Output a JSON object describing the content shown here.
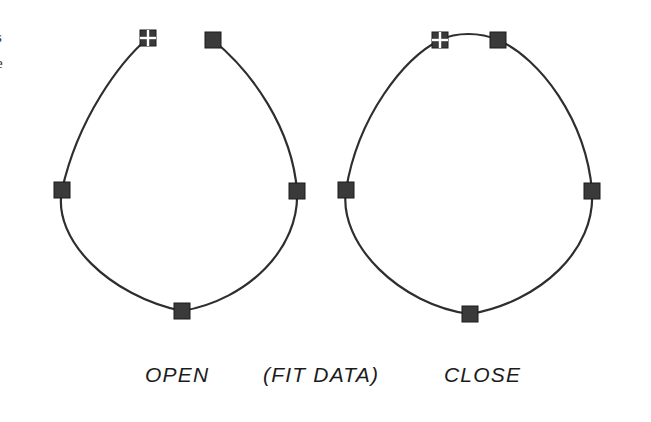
{
  "figure": {
    "type": "spline-curve-diagram",
    "background_color": "#ffffff",
    "stroke_color": "#2e2e2e",
    "marker_fill_color": "#3a3a3a",
    "marker_edge_color": "#1a1a1a",
    "marker_divider_color": "#ffffff",
    "labels": {
      "open": "OPEN",
      "fit_data": "(FIT DATA)",
      "close": "CLOSE"
    },
    "page_edge_fragments": {
      "fragment_1": "s",
      "fragment_2": "e"
    },
    "curves": [
      {
        "name": "open-curve",
        "label": "OPEN",
        "closed": false,
        "description": "Open spline: gap between start marker and end marker at top",
        "control_points": [
          {
            "name": "start-point",
            "marker": "quadrant-square",
            "x": 148,
            "y": 38
          },
          {
            "name": "left-point",
            "marker": "solid-square",
            "x": 62,
            "y": 190
          },
          {
            "name": "bottom-point",
            "marker": "solid-square",
            "x": 182,
            "y": 311
          },
          {
            "name": "right-point",
            "marker": "solid-square",
            "x": 297,
            "y": 191
          },
          {
            "name": "end-point",
            "marker": "solid-square",
            "x": 213,
            "y": 40
          }
        ]
      },
      {
        "name": "close-curve",
        "label": "CLOSE",
        "closed": true,
        "description": "Closed spline: start and end markers joined by curve at top",
        "control_points": [
          {
            "name": "start-point",
            "marker": "quadrant-square",
            "x": 440,
            "y": 40
          },
          {
            "name": "left-point",
            "marker": "solid-square",
            "x": 346,
            "y": 190
          },
          {
            "name": "bottom-point",
            "marker": "solid-square",
            "x": 470,
            "y": 314
          },
          {
            "name": "right-point",
            "marker": "solid-square",
            "x": 592,
            "y": 191
          },
          {
            "name": "end-point",
            "marker": "solid-square",
            "x": 498,
            "y": 40
          }
        ]
      }
    ],
    "marker_size": 16,
    "stroke_width": 2.2
  }
}
